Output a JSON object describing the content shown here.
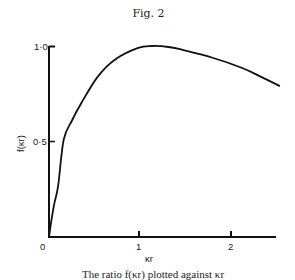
{
  "figure": {
    "title": "Fig. 2",
    "caption": "The ratio f(κr) plotted against κr"
  },
  "chart_data": {
    "type": "line",
    "title": "Fig. 2",
    "xlabel": "κr",
    "ylabel": "f(κr)",
    "xlim": [
      0,
      2.5
    ],
    "ylim": [
      0,
      1.0
    ],
    "x_ticks": [
      "0",
      "1",
      "2"
    ],
    "y_ticks": [
      "0",
      "0·5",
      "1·0"
    ],
    "grid": false,
    "legend": null,
    "series": [
      {
        "name": "f(κr)",
        "x": [
          0.0,
          0.03,
          0.06,
          0.1,
          0.16,
          0.25,
          0.35,
          0.53,
          0.72,
          0.97,
          1.12,
          1.3,
          1.45,
          1.77,
          2.1,
          2.3,
          2.51
        ],
        "y": [
          0.0,
          0.1,
          0.18,
          0.27,
          0.51,
          0.61,
          0.7,
          0.84,
          0.93,
          0.99,
          1.0,
          0.995,
          0.98,
          0.94,
          0.885,
          0.84,
          0.79
        ]
      }
    ]
  }
}
